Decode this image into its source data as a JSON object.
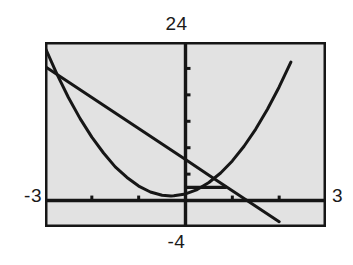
{
  "figure": {
    "kind": "graphing-calculator-screen",
    "caption": "",
    "screen_background": "#e2e2e2",
    "border_color": "#161616",
    "trace_color": "#161616"
  },
  "labels": {
    "ymax": "24",
    "ymin": "-4",
    "xmin": "-3",
    "xmax": "3"
  },
  "chart_data": {
    "type": "line",
    "title": "",
    "xlabel": "",
    "ylabel": "",
    "xlim": [
      -3,
      3
    ],
    "ylim": [
      -4,
      24
    ],
    "grid": false,
    "legend": "none",
    "axes": {
      "x_axis_at_y": 0,
      "y_axis_at_x": 0,
      "x_tick_spacing": 1,
      "y_tick_spacing": 4,
      "x_ticks": [
        -2,
        -1,
        1,
        2
      ],
      "y_ticks": [
        4,
        8,
        12,
        16,
        20
      ]
    },
    "annotations": [
      {
        "name": "horizontal-cursor-segment",
        "type": "segment",
        "x": [
          0.0,
          0.88
        ],
        "y": [
          2.0,
          2.0
        ]
      }
    ],
    "series": [
      {
        "name": "line",
        "type": "line",
        "equation": "y = -4.7x + 6.2",
        "x": [
          -3.0,
          -2.5,
          -2.0,
          -1.5,
          -1.0,
          -0.5,
          0.0,
          0.5,
          1.0,
          1.5,
          2.0,
          2.5,
          3.0
        ],
        "values": [
          20.3,
          17.95,
          15.6,
          13.25,
          10.9,
          8.55,
          6.2,
          3.85,
          1.5,
          -0.85,
          -3.2,
          -5.55,
          -7.9
        ]
      },
      {
        "name": "parabola",
        "type": "line",
        "equation": "y = 3.1x^2 + 1.9x + 1.0",
        "x": [
          -3.0,
          -2.75,
          -2.5,
          -2.25,
          -2.0,
          -1.75,
          -1.5,
          -1.25,
          -1.0,
          -0.75,
          -0.5,
          -0.31,
          -0.25,
          0.0,
          0.25,
          0.5,
          0.75,
          1.0,
          1.25,
          1.5,
          1.75,
          2.0,
          2.25,
          2.5,
          2.75,
          3.0
        ],
        "values": [
          23.2,
          19.2,
          15.6,
          12.4,
          9.6,
          7.2,
          5.1,
          3.5,
          2.2,
          1.3,
          0.8,
          0.71,
          0.72,
          1.0,
          1.67,
          2.73,
          4.17,
          6.0,
          8.22,
          10.82,
          13.82,
          17.2,
          20.97,
          25.13,
          29.67,
          34.6
        ]
      }
    ],
    "intersections": [
      {
        "name": "left-intersection",
        "x": -2.35,
        "y": 17.25
      },
      {
        "name": "right-intersection",
        "x": 0.85,
        "y": 2.2
      }
    ],
    "x_intercepts_of_line": [
      1.32
    ]
  }
}
